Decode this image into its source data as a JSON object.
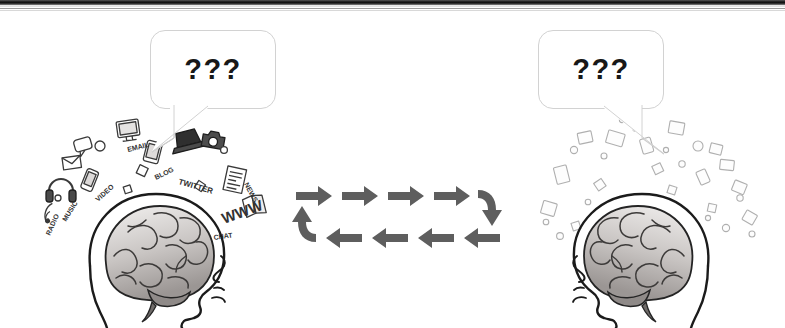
{
  "page": {
    "width": 785,
    "height": 328,
    "background_color": "#ffffff",
    "scan_border_color": "#111111",
    "line_art_color": "#2b2b2b"
  },
  "bubbles": [
    {
      "id": "left-thought-bubble",
      "text": "???",
      "tail_direction": "down-left",
      "border_color": "#d2d2d2",
      "fill_color": "#ffffff",
      "text_color": "#181818"
    },
    {
      "id": "right-thought-bubble",
      "text": "???",
      "tail_direction": "down-right",
      "border_color": "#d2d2d2",
      "fill_color": "#ffffff",
      "text_color": "#181818"
    }
  ],
  "arrow_cycle": {
    "name": "bidirectional-exchange-loop",
    "color": "#5e5e5e",
    "top_row_direction": "right",
    "bottom_row_direction": "left",
    "top_arrow_count": 4,
    "bottom_arrow_count": 4,
    "right_corner": "curved-down-arrow",
    "left_corner": "curved-up-arrow"
  },
  "figures": [
    {
      "id": "left-head",
      "facing": "right",
      "brain_label": "brain",
      "icon_cloud": {
        "style": "sharp",
        "description": "dense cloud of media and technology icons",
        "sample_words": [
          "WWW",
          "TWITTER",
          "BLOG",
          "NEWS",
          "MUSIC"
        ]
      }
    },
    {
      "id": "right-head",
      "facing": "left",
      "brain_label": "brain",
      "icon_cloud": {
        "style": "faded",
        "description": "faded blurred cloud of unreadable media fragments",
        "sample_words": []
      }
    }
  ]
}
